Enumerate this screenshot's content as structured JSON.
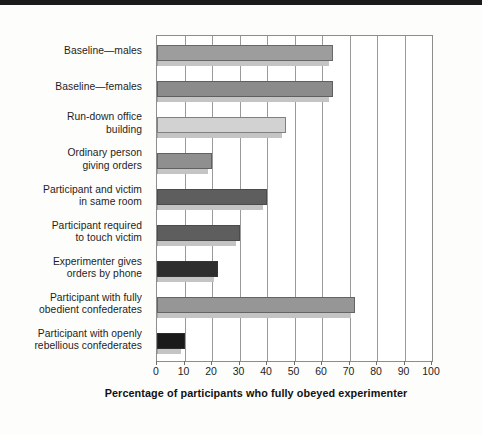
{
  "chart_data": {
    "type": "bar",
    "orientation": "horizontal",
    "title": "",
    "xlabel": "Percentage of participants who fully obeyed experimenter",
    "ylabel": "",
    "xlim": [
      0,
      100
    ],
    "xticks": [
      0,
      10,
      20,
      30,
      40,
      50,
      60,
      70,
      80,
      90,
      100
    ],
    "grid": true,
    "legend": "none",
    "categories": [
      "Baseline—males",
      "Baseline—females",
      "Run-down office building",
      "Ordinary person giving orders",
      "Participant and victim in same room",
      "Participant required to touch victim",
      "Experimenter gives orders by phone",
      "Participant with fully obedient confederates",
      "Participant with openly rebellious confederates"
    ],
    "category_lines": [
      [
        "Baseline—males"
      ],
      [
        "Baseline—females"
      ],
      [
        "Run-down office",
        "building"
      ],
      [
        "Ordinary person",
        "giving orders"
      ],
      [
        "Participant and victim",
        "in same room"
      ],
      [
        "Participant required",
        "to touch victim"
      ],
      [
        "Experimenter gives",
        "orders by phone"
      ],
      [
        "Participant with fully",
        "obedient confederates"
      ],
      [
        "Participant with openly",
        "rebellious confederates"
      ]
    ],
    "values": [
      64,
      64,
      47,
      20,
      40,
      30,
      22,
      72,
      10
    ],
    "bar_colors": [
      "#9d9d9d",
      "#8b8b8b",
      "#d2d2d2",
      "#8f8f8f",
      "#5e5e5e",
      "#5e5e5e",
      "#2e2e2e",
      "#969696",
      "#1a1a1a"
    ]
  },
  "axis": {
    "tick_0": "0",
    "tick_10": "10",
    "tick_20": "20",
    "tick_30": "30",
    "tick_40": "40",
    "tick_50": "50",
    "tick_60": "60",
    "tick_70": "70",
    "tick_80": "80",
    "tick_90": "90",
    "tick_100": "100"
  },
  "colors": {
    "background": "#fdfdfc",
    "plot_background": "#ffffff",
    "axis_line": "#8d8d8d",
    "gridline": "#9a9a9a",
    "text": "#1d1d1d",
    "top_band": "#1b1b1b"
  }
}
